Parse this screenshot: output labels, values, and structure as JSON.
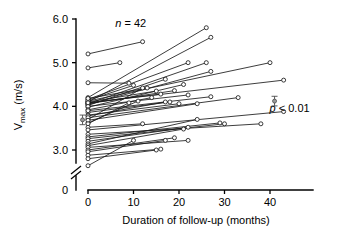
{
  "chart_data": {
    "type": "line",
    "title": "",
    "subtitle": "",
    "xlabel": "Duration of follow-up (months)",
    "ylabel": "Vmax (m/s)",
    "ylabel_main": "V",
    "ylabel_sub": "max",
    "ylabel_units": " (m/s)",
    "xlim": [
      0,
      47
    ],
    "ylim": [
      2.55,
      6.0
    ],
    "grid": false,
    "legend": "none",
    "xticks": [
      0,
      10,
      20,
      30,
      40
    ],
    "xtick_labels": [
      "0",
      "10",
      "20",
      "30",
      "40"
    ],
    "yticks": [
      3.0,
      4.0,
      5.0,
      6.0
    ],
    "ytick_labels": [
      "3.0",
      "4.0",
      "5.0",
      "6.0"
    ],
    "y_origin_label": "0",
    "axis_break": true,
    "annotations": [
      {
        "name": "sample-size",
        "text": "n = 42",
        "italic_prefix": "n",
        "rest": " = 42",
        "x": 6,
        "y": 5.82
      },
      {
        "name": "p-value",
        "text": "p < 0.01",
        "italic_prefix": "p",
        "rest": " < 0.01",
        "x": 41,
        "y": 3.88
      }
    ],
    "mean_markers": [
      {
        "name": "baseline-mean-marker",
        "x": -1.2,
        "y": 3.69,
        "err": 0.055
      },
      {
        "name": "followup-mean-marker",
        "x": 41.0,
        "y": 4.12,
        "err": 0.055
      }
    ],
    "series_note": "42 paired subjects; each line joins a baseline measurement at 0 months to a follow-up measurement",
    "series": [
      {
        "name": "s1",
        "x": [
          0,
          12
        ],
        "y": [
          5.2,
          5.48
        ]
      },
      {
        "name": "s2",
        "x": [
          0,
          7
        ],
        "y": [
          4.88,
          5.0
        ]
      },
      {
        "name": "s3",
        "x": [
          0,
          9
        ],
        "y": [
          4.54,
          4.53
        ]
      },
      {
        "name": "s4",
        "x": [
          0,
          26
        ],
        "y": [
          4.2,
          5.8
        ]
      },
      {
        "name": "s5",
        "x": [
          0,
          27
        ],
        "y": [
          4.1,
          5.58
        ]
      },
      {
        "name": "s6",
        "x": [
          0,
          22
        ],
        "y": [
          4.16,
          5.0
        ]
      },
      {
        "name": "s7",
        "x": [
          0,
          26
        ],
        "y": [
          4.06,
          5.0
        ]
      },
      {
        "name": "s8",
        "x": [
          0,
          27
        ],
        "y": [
          4.04,
          4.8
        ]
      },
      {
        "name": "s9",
        "x": [
          0,
          40
        ],
        "y": [
          4.12,
          5.0
        ]
      },
      {
        "name": "s10",
        "x": [
          0,
          43
        ],
        "y": [
          4.08,
          4.6
        ]
      },
      {
        "name": "s11",
        "x": [
          0,
          17
        ],
        "y": [
          4.02,
          4.62
        ]
      },
      {
        "name": "s12",
        "x": [
          0,
          21
        ],
        "y": [
          3.98,
          4.5
        ]
      },
      {
        "name": "s13",
        "x": [
          0,
          15
        ],
        "y": [
          4.1,
          4.35
        ]
      },
      {
        "name": "s14",
        "x": [
          0,
          19
        ],
        "y": [
          4.06,
          4.36
        ]
      },
      {
        "name": "s15",
        "x": [
          0,
          22
        ],
        "y": [
          4.0,
          4.26
        ]
      },
      {
        "name": "s16",
        "x": [
          0,
          10
        ],
        "y": [
          4.14,
          4.48
        ]
      },
      {
        "name": "s17",
        "x": [
          0,
          13
        ],
        "y": [
          4.18,
          4.42
        ]
      },
      {
        "name": "s18",
        "x": [
          0,
          16
        ],
        "y": [
          4.08,
          4.28
        ]
      },
      {
        "name": "s19",
        "x": [
          0,
          14
        ],
        "y": [
          3.92,
          4.2
        ]
      },
      {
        "name": "s20",
        "x": [
          0,
          18
        ],
        "y": [
          3.86,
          4.1
        ]
      },
      {
        "name": "s21",
        "x": [
          0,
          20
        ],
        "y": [
          3.8,
          4.06
        ]
      },
      {
        "name": "s22",
        "x": [
          0,
          27
        ],
        "y": [
          3.9,
          4.22
        ]
      },
      {
        "name": "s23",
        "x": [
          0,
          12
        ],
        "y": [
          3.7,
          4.42
        ]
      },
      {
        "name": "s24",
        "x": [
          0,
          11
        ],
        "y": [
          3.62,
          4.12
        ]
      },
      {
        "name": "s25",
        "x": [
          0,
          17
        ],
        "y": [
          3.78,
          4.1
        ]
      },
      {
        "name": "s26",
        "x": [
          0,
          33
        ],
        "y": [
          3.74,
          4.2
        ]
      },
      {
        "name": "s27",
        "x": [
          0,
          24
        ],
        "y": [
          3.68,
          4.06
        ]
      },
      {
        "name": "s28",
        "x": [
          0,
          9
        ],
        "y": [
          3.6,
          4.08
        ]
      },
      {
        "name": "s29",
        "x": [
          0,
          12
        ],
        "y": [
          3.52,
          3.6
        ]
      },
      {
        "name": "s30",
        "x": [
          0,
          43
        ],
        "y": [
          3.46,
          3.88
        ]
      },
      {
        "name": "s31",
        "x": [
          0,
          38
        ],
        "y": [
          3.36,
          3.6
        ]
      },
      {
        "name": "s32",
        "x": [
          0,
          29
        ],
        "y": [
          3.3,
          3.62
        ]
      },
      {
        "name": "s33",
        "x": [
          0,
          30
        ],
        "y": [
          3.26,
          3.6
        ]
      },
      {
        "name": "s34",
        "x": [
          0,
          22
        ],
        "y": [
          3.2,
          3.52
        ]
      },
      {
        "name": "s35",
        "x": [
          0,
          24
        ],
        "y": [
          3.14,
          3.7
        ]
      },
      {
        "name": "s36",
        "x": [
          0,
          21
        ],
        "y": [
          3.1,
          3.48
        ]
      },
      {
        "name": "s37",
        "x": [
          0,
          22
        ],
        "y": [
          3.06,
          3.22
        ]
      },
      {
        "name": "s38",
        "x": [
          0,
          19
        ],
        "y": [
          3.0,
          3.28
        ]
      },
      {
        "name": "s39",
        "x": [
          0,
          17
        ],
        "y": [
          2.96,
          3.22
        ]
      },
      {
        "name": "s40",
        "x": [
          0,
          16
        ],
        "y": [
          2.88,
          3.02
        ]
      },
      {
        "name": "s41",
        "x": [
          0,
          15
        ],
        "y": [
          2.8,
          3.0
        ]
      },
      {
        "name": "s42",
        "x": [
          0,
          10
        ],
        "y": [
          2.64,
          3.22
        ]
      }
    ]
  }
}
